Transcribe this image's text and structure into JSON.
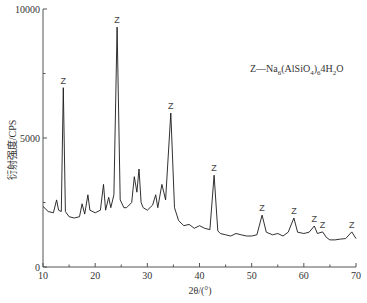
{
  "chart_data": {
    "type": "line",
    "title": "",
    "xlabel": "2θ/(°)",
    "ylabel": "衍射强度/CPS",
    "xlim": [
      10,
      70
    ],
    "ylim": [
      0,
      10000
    ],
    "x_ticks": [
      10,
      20,
      30,
      40,
      50,
      60,
      70
    ],
    "y_ticks": [
      0,
      5000,
      10000
    ],
    "grid": false,
    "legend": "Z—Na6(AlSiO4)6·4H2O",
    "series": [
      {
        "name": "XRD pattern",
        "x": [
          10,
          11,
          12,
          12.6,
          13,
          13.5,
          13.9,
          14.3,
          15,
          16,
          17,
          17.5,
          18,
          18.6,
          19,
          20,
          21,
          21.6,
          22,
          22.6,
          23,
          23.6,
          24.2,
          24.8,
          25.5,
          26,
          27,
          27.5,
          28,
          28.4,
          28.8,
          29.2,
          30,
          31,
          31.6,
          32,
          32.8,
          33.5,
          34.5,
          35.2,
          36,
          37,
          38,
          39,
          40,
          41,
          42,
          42.8,
          43.5,
          44,
          45,
          46,
          47,
          48,
          49,
          50,
          51,
          52,
          52.8,
          54,
          55,
          56,
          57,
          58.1,
          58.8,
          60,
          61,
          62,
          62.6,
          63.6,
          64.3,
          65,
          66,
          67,
          68,
          69.2,
          70
        ],
        "y": [
          2350,
          2150,
          2100,
          2600,
          2200,
          2150,
          6950,
          2150,
          1950,
          1900,
          1950,
          2450,
          2050,
          2800,
          2200,
          2100,
          2200,
          3200,
          2200,
          2700,
          2300,
          2800,
          9300,
          2600,
          2300,
          2300,
          2500,
          3500,
          2900,
          3800,
          2500,
          2300,
          2200,
          2400,
          2800,
          2300,
          3200,
          2600,
          5970,
          2300,
          1800,
          1600,
          1650,
          1500,
          1600,
          1500,
          1450,
          3560,
          1400,
          1300,
          1250,
          1200,
          1300,
          1250,
          1200,
          1200,
          1250,
          2010,
          1350,
          1250,
          1300,
          1200,
          1350,
          1900,
          1350,
          1300,
          1350,
          1590,
          1300,
          1360,
          1150,
          1050,
          1050,
          1080,
          1100,
          1360,
          1100
        ]
      }
    ],
    "peaks_labeled": [
      {
        "label": "Z",
        "x": 13.9,
        "y": 6950
      },
      {
        "label": "Z",
        "x": 24.2,
        "y": 9300
      },
      {
        "label": "Z",
        "x": 34.5,
        "y": 5970
      },
      {
        "label": "Z",
        "x": 42.8,
        "y": 3560
      },
      {
        "label": "Z",
        "x": 52.0,
        "y": 2010
      },
      {
        "label": "Z",
        "x": 58.1,
        "y": 1900
      },
      {
        "label": "Z",
        "x": 62.0,
        "y": 1590
      },
      {
        "label": "Z",
        "x": 63.6,
        "y": 1360
      },
      {
        "label": "Z",
        "x": 69.2,
        "y": 1360
      }
    ]
  },
  "labels": {
    "ylabel": "衍射强度/CPS",
    "xlabel_prefix": "2θ/(°)",
    "legend_prefix": "Z—Na",
    "legend_sub1": "6",
    "legend_mid": "(AlSiO",
    "legend_sub2": "4",
    "legend_close": ")",
    "legend_sub3": "6",
    "legend_mid2": "4H",
    "legend_sub4": "2",
    "legend_end": "O"
  }
}
